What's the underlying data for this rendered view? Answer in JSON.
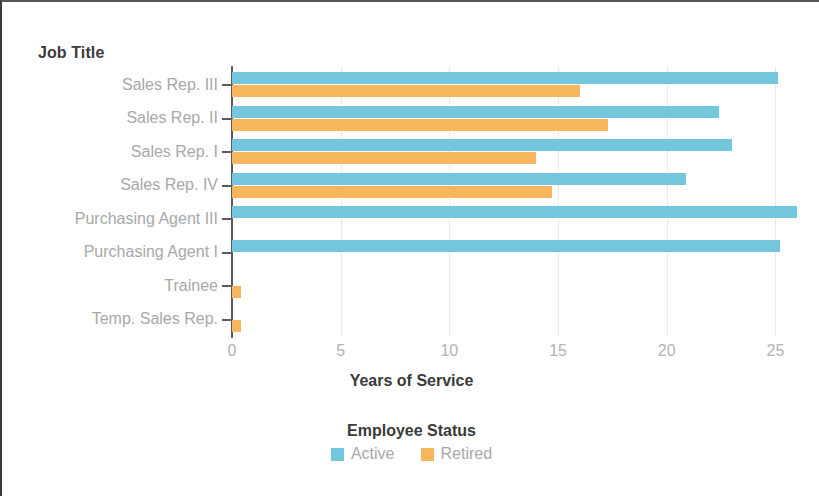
{
  "chart_data": {
    "type": "bar",
    "orientation": "horizontal",
    "title": "",
    "xlabel": "Years of Service",
    "ylabel": "Job Title",
    "legend_title": "Employee Status",
    "legend_position": "bottom",
    "grid": true,
    "xlim": [
      0,
      26.5
    ],
    "xticks": [
      0,
      5,
      10,
      15,
      20,
      25
    ],
    "xtick_labels": [
      "0",
      "5",
      "10",
      "15",
      "20",
      "25"
    ],
    "categories": [
      "Sales Rep. III",
      "Sales Rep. II",
      "Sales Rep. I",
      "Sales Rep. IV",
      "Purchasing Agent III",
      "Purchasing Agent I",
      "Trainee",
      "Temp. Sales Rep."
    ],
    "series": [
      {
        "name": "Active",
        "color": "#74c6dd",
        "values": [
          25.1,
          22.4,
          23.0,
          20.9,
          26.0,
          25.2,
          0,
          0
        ]
      },
      {
        "name": "Retired",
        "color": "#f5b65c",
        "values": [
          16.0,
          17.3,
          14.0,
          14.7,
          0,
          0,
          0.4,
          0.4
        ]
      }
    ]
  },
  "colors": {
    "active": "#74c6dd",
    "retired": "#f5b65c",
    "axis": "#5a5a5a",
    "tick_text": "#b3b3b3",
    "title_text": "#3a3a3a",
    "grid": "#d8d8d8",
    "background": "#ffffff"
  }
}
